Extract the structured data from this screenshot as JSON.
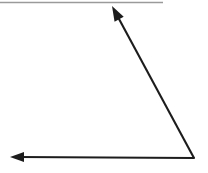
{
  "canvas": {
    "width": 208,
    "height": 173,
    "background_color": "#ffffff",
    "title": "Angle Figure"
  },
  "top_rule": {
    "name": "horizontal-rule",
    "color": "#9a9a9a",
    "x1": 0,
    "y1": 2.5,
    "x2": 163,
    "y2": 2.5,
    "stroke_width": 1.4
  },
  "figure": {
    "type": "angle",
    "stroke_color": "#1c1c1c",
    "stroke_width": 2.1,
    "vertex": {
      "x": 194,
      "y": 158
    },
    "rays": [
      {
        "name": "upper-ray",
        "from": {
          "x": 194,
          "y": 158
        },
        "to": {
          "x": 112,
          "y": 6
        },
        "arrowhead": "at-tip",
        "arrowhead_length": 15,
        "arrowhead_half_width": 5.2
      },
      {
        "name": "lower-ray",
        "from": {
          "x": 194,
          "y": 158
        },
        "to": {
          "x": 10,
          "y": 157
        },
        "arrowhead": "at-tip",
        "arrowhead_length": 14,
        "arrowhead_half_width": 5.0
      }
    ]
  },
  "chart_data": {
    "type": "scatter",
    "title": "Angle formed by two rays sharing a common vertex",
    "xlabel": "",
    "ylabel": "",
    "xlim": [
      0,
      208
    ],
    "ylim": [
      0,
      173
    ],
    "grid": false,
    "legend": "none",
    "annotations": [
      "Vertex at lower right of figure",
      "One ray extends up and to the left",
      "One ray extends left, nearly horizontal",
      "Both rays terminate in solid arrowheads"
    ],
    "series": [
      {
        "name": "upper-ray",
        "x": [
          194,
          112
        ],
        "y": [
          158,
          6
        ]
      },
      {
        "name": "lower-ray",
        "x": [
          194,
          10
        ],
        "y": [
          158,
          157
        ]
      }
    ]
  }
}
